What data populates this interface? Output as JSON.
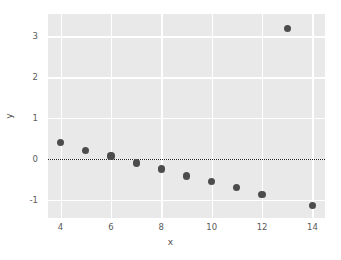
{
  "chart_data": {
    "type": "scatter",
    "title": "",
    "xlabel": "x",
    "ylabel": "y",
    "xlim": [
      3.5,
      14.5
    ],
    "ylim": [
      -1.45,
      3.55
    ],
    "grid": true,
    "legend": null,
    "x": [
      4,
      5,
      6,
      7,
      8,
      9,
      10,
      11,
      12,
      13,
      14
    ],
    "values": [
      0.4,
      0.2,
      0.07,
      -0.1,
      -0.25,
      -0.42,
      -0.55,
      -0.7,
      -0.87,
      3.2,
      -1.15
    ],
    "series": [
      {
        "name": "residuals",
        "x": [
          4,
          5,
          6,
          7,
          8,
          9,
          10,
          11,
          12,
          13,
          14
        ],
        "values": [
          0.4,
          0.2,
          0.07,
          -0.1,
          -0.25,
          -0.42,
          -0.55,
          -0.7,
          -0.87,
          3.2,
          -1.15
        ]
      }
    ],
    "xticks": [
      4,
      6,
      8,
      10,
      12,
      14
    ],
    "yticks": [
      3,
      2,
      1,
      0,
      -1
    ],
    "xtick_labels": [
      "4",
      "6",
      "8",
      "10",
      "12",
      "14"
    ],
    "ytick_labels": [
      "3",
      "2",
      "1",
      "0",
      "-1"
    ],
    "reference_lines": [
      {
        "axis": "y",
        "value": 0,
        "style": "dotted",
        "color": "#1b1b1b"
      }
    ],
    "annotations": [],
    "colors": {
      "point": "#4c4c4c",
      "plot_background": "#e9e9e9",
      "gridline": "#ffffff",
      "figure_background": "#ffffff",
      "tick_label": "#5a5a5a",
      "axis_label": "#4f4f4f"
    }
  }
}
